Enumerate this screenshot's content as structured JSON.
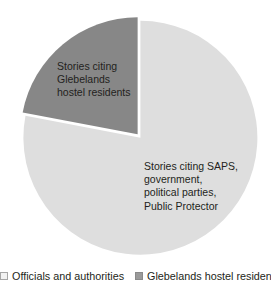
{
  "chart_data": {
    "type": "pie",
    "title": "",
    "subtitle": "",
    "xlabel": "",
    "ylabel": "",
    "grid": false,
    "legend_position": "bottom",
    "categories": [
      "Officials and authorities",
      "Glebelands hostel residents"
    ],
    "values": [
      78,
      22
    ],
    "slices": [
      {
        "name": "Officials and authorities",
        "value": 78,
        "color": "#dedede",
        "label_lines": [
          "Stories citing SAPS,",
          "government,",
          "political parties,",
          "Public Protector"
        ]
      },
      {
        "name": "Glebelands hostel residents",
        "value": 22,
        "color": "#878787",
        "label_lines": [
          "Stories citing",
          "Glebelands",
          "hostel residents"
        ]
      }
    ]
  },
  "legend": {
    "items": [
      {
        "label": "Officials and authorities",
        "swatch": "light-square-icon"
      },
      {
        "label": "Glebelands hostel residents",
        "swatch": "dark-square-icon"
      }
    ]
  },
  "colors": {
    "slice_light": "#dedede",
    "slice_dark": "#878787",
    "text": "#231f20",
    "background": "#ffffff",
    "separator": "#ffffff"
  }
}
